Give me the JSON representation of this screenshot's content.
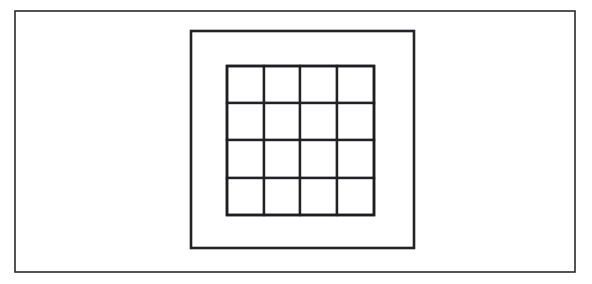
{
  "figure": {
    "canvas": {
      "width": 592,
      "height": 284
    },
    "background_color": "#ffffff",
    "line_color": "#222226",
    "shapes": {
      "outer_rectangle": {
        "name": "outer-rectangle",
        "x": 15,
        "y": 11,
        "width": 560,
        "height": 261,
        "stroke_width": 1.6,
        "stroke_color": "#2a2a2e",
        "fill": "#ffffff"
      },
      "middle_rectangle": {
        "name": "middle-rectangle",
        "x": 191,
        "y": 31,
        "width": 223,
        "height": 217,
        "stroke_width": 2.6,
        "stroke_color": "#232327",
        "fill": "#ffffff"
      },
      "grid": {
        "name": "inner-grid",
        "rows": 4,
        "columns": 4,
        "cell_count": 16,
        "x": 227,
        "y": 66,
        "width": 147,
        "height": 149,
        "column_edges": [
          227,
          264,
          300,
          337,
          374
        ],
        "row_edges": [
          66,
          103,
          140,
          178,
          215
        ],
        "stroke_width": 2.4,
        "stroke_color": "#222226",
        "fill": "#ffffff"
      }
    },
    "cells": [
      {
        "row": 1,
        "col": 1,
        "label": ""
      },
      {
        "row": 1,
        "col": 2,
        "label": ""
      },
      {
        "row": 1,
        "col": 3,
        "label": ""
      },
      {
        "row": 1,
        "col": 4,
        "label": ""
      },
      {
        "row": 2,
        "col": 1,
        "label": ""
      },
      {
        "row": 2,
        "col": 2,
        "label": ""
      },
      {
        "row": 2,
        "col": 3,
        "label": ""
      },
      {
        "row": 2,
        "col": 4,
        "label": ""
      },
      {
        "row": 3,
        "col": 1,
        "label": ""
      },
      {
        "row": 3,
        "col": 2,
        "label": ""
      },
      {
        "row": 3,
        "col": 3,
        "label": ""
      },
      {
        "row": 3,
        "col": 4,
        "label": ""
      },
      {
        "row": 4,
        "col": 1,
        "label": ""
      },
      {
        "row": 4,
        "col": 2,
        "label": ""
      },
      {
        "row": 4,
        "col": 3,
        "label": ""
      },
      {
        "row": 4,
        "col": 4,
        "label": ""
      }
    ]
  }
}
